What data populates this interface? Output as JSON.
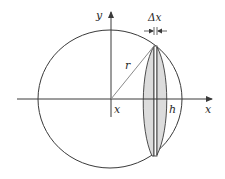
{
  "diagram": {
    "labels": {
      "y_axis": "y",
      "x_axis": "x",
      "radius": "r",
      "slice_position": "x",
      "cap_height": "h",
      "slice_width": "Δx"
    },
    "colors": {
      "stroke": "#3a3a3a",
      "radius_line": "#8a8a8a",
      "slice_fill": "#dcdcdc",
      "background": "#ffffff"
    },
    "geometry": {
      "circle_center": [
        110,
        99
      ],
      "circle_rx": 72,
      "circle_ry": 69
    }
  }
}
